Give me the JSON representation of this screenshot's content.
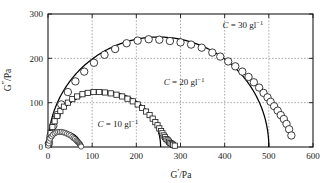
{
  "chart_data": {
    "type": "scatter",
    "title": "",
    "subtitle": "",
    "xlabel": "G'/Pa",
    "ylabel": "G''/Pa",
    "xlim": [
      0,
      600
    ],
    "ylim": [
      0,
      300
    ],
    "xticks": [
      0,
      100,
      200,
      300,
      400,
      500,
      600
    ],
    "yticks": [
      0,
      100,
      200,
      300
    ],
    "xtick_labels": [
      "0",
      "100",
      "200",
      "300",
      "400",
      "500",
      "600"
    ],
    "ytick_labels": [
      "0",
      "100",
      "200",
      "300"
    ],
    "grid": true,
    "grid_style": "dotted",
    "legend": "none",
    "annotations": [
      {
        "text": "C = 30 gl⁻¹",
        "symbol": "C",
        "value": "30",
        "unit": "gl⁻¹",
        "x": 395,
        "y": 268
      },
      {
        "text": "C = 20 gl⁻¹",
        "symbol": "C",
        "value": "20",
        "unit": "gl⁻¹",
        "x": 262,
        "y": 140
      },
      {
        "text": "C = 10 gl⁻¹",
        "symbol": "C",
        "value": "10",
        "unit": "gl⁻¹",
        "x": 112,
        "y": 45
      }
    ],
    "series": [
      {
        "name": "C = 30 gl-1",
        "marker": "circle",
        "marker_size": 4.6,
        "concentration": 30,
        "fit": {
          "type": "semicircle",
          "x_start": 0,
          "x_end": 500,
          "peak": 248
        },
        "x": [
          2,
          6,
          12,
          20,
          30,
          45,
          62,
          82,
          104,
          128,
          152,
          178,
          203,
          228,
          252,
          276,
          300,
          324,
          348,
          372,
          390,
          408,
          424,
          440,
          454,
          466,
          478,
          488,
          497,
          504,
          512,
          520,
          527,
          534,
          540,
          546,
          551
        ],
        "y": [
          8,
          26,
          48,
          72,
          96,
          124,
          148,
          170,
          190,
          208,
          221,
          234,
          240,
          243,
          242,
          239,
          236,
          231,
          224,
          213,
          204,
          193,
          182,
          170,
          158,
          146,
          134,
          122,
          112,
          102,
          92,
          82,
          72,
          63,
          52,
          40,
          26
        ]
      },
      {
        "name": "C = 20 gl-1",
        "marker": "square",
        "marker_size": 4.0,
        "concentration": 20,
        "fit": {
          "type": "semicircle",
          "x_start": 0,
          "x_end": 255,
          "peak": 125
        },
        "x": [
          1,
          3,
          6,
          10,
          15,
          21,
          28,
          36,
          45,
          55,
          66,
          78,
          90,
          103,
          116,
          129,
          142,
          155,
          168,
          180,
          192,
          203,
          213,
          222,
          230,
          237,
          243,
          248,
          252,
          256,
          259,
          262,
          265,
          268,
          271,
          274,
          277,
          280,
          283,
          287
        ],
        "y": [
          5,
          17,
          31,
          45,
          58,
          70,
          81,
          91,
          100,
          108,
          114,
          119,
          122,
          124,
          124,
          123,
          121,
          118,
          114,
          109,
          103,
          96,
          88,
          80,
          72,
          64,
          56,
          49,
          42,
          36,
          31,
          26,
          22,
          18,
          15,
          12,
          9,
          7,
          5,
          3
        ]
      },
      {
        "name": "C = 10 gl-1",
        "marker": "circle-small",
        "marker_size": 2.4,
        "concentration": 10,
        "fit": {
          "type": "semicircle",
          "x_start": 0,
          "x_end": 75,
          "peak": 34
        },
        "x": [
          0.5,
          1.5,
          3,
          5,
          8,
          11,
          15,
          19,
          23,
          27,
          31,
          35,
          39,
          43,
          47,
          51,
          55,
          58,
          61,
          64,
          66,
          68,
          70,
          72,
          73,
          74,
          75
        ],
        "y": [
          3,
          8,
          14,
          19,
          24,
          28,
          31,
          33,
          34,
          34,
          34,
          33,
          32,
          30,
          28,
          26,
          23,
          20,
          18,
          15,
          13,
          11,
          9,
          7,
          5,
          3,
          1
        ]
      }
    ]
  },
  "figure": {
    "background": "#ffffff",
    "axis_color": "#1a1a1a",
    "grid_color": "#8a8a8a",
    "marker_edge_color": "#1a1a1a",
    "marker_fill_color": "#ffffff",
    "fit_line_color": "#000000"
  }
}
